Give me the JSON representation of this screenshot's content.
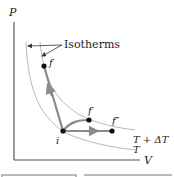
{
  "diagram": {
    "type": "PV diagram",
    "axes": {
      "y_label": "P",
      "x_label": "V"
    },
    "annotation": "Isotherms",
    "isotherms": [
      {
        "label": "T + ΔT"
      },
      {
        "label": "T"
      }
    ],
    "points": [
      {
        "id": "i",
        "label": "i"
      },
      {
        "id": "f",
        "label": "f"
      },
      {
        "id": "f1",
        "label": "f′"
      },
      {
        "id": "f2",
        "label": "f″"
      }
    ],
    "paths": [
      {
        "from": "i",
        "to": "f",
        "description": "constant volume-ish path to f"
      },
      {
        "from": "i",
        "to": "f1",
        "description": "curved path to f′"
      },
      {
        "from": "i",
        "to": "f2",
        "description": "constant pressure path to f″"
      }
    ],
    "colors": {
      "axis": "#555555",
      "isotherm": "#b8b8b8",
      "path": "#8a8a8a",
      "point": "#111111",
      "arrow": "#333333"
    }
  }
}
